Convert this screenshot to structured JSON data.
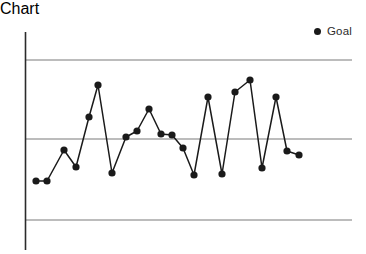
{
  "chart_data": {
    "type": "line",
    "title": "",
    "subtitle": "",
    "xlabel": "",
    "ylabel": "",
    "grid": false,
    "legend": {
      "position": "top-right",
      "entries": [
        {
          "label": "Goal",
          "marker": "filled-circle",
          "color": "#1a1a1a"
        }
      ]
    },
    "axis": {
      "y_axis_line": true,
      "x_axis_line": false,
      "xlim": [
        0,
        28
      ],
      "ylim": [
        -1.45,
        1.45
      ],
      "tick_labels_x": [],
      "tick_labels_y": []
    },
    "reference_lines": [
      {
        "name": "upper-limit",
        "value": 1.0,
        "color": "#7a7a7a"
      },
      {
        "name": "goal-center-line",
        "value": 0.0,
        "color": "#7a7a7a"
      },
      {
        "name": "lower-limit",
        "value": -1.0,
        "color": "#7a7a7a"
      }
    ],
    "series": [
      {
        "name": "Goal",
        "color": "#1a1a1a",
        "marker": "filled-circle",
        "x": [
          1,
          2,
          3,
          4,
          5,
          6,
          7,
          8,
          9,
          10,
          11,
          12,
          13,
          14,
          15,
          16,
          17,
          18,
          19,
          20,
          21,
          22,
          23,
          24,
          25,
          26,
          27
        ],
        "values": [
          -0.53,
          -0.53,
          -0.1,
          -0.39,
          0.35,
          0.68,
          -0.43,
          -0.01,
          0.09,
          0.38,
          0.15,
          0.13,
          -0.16,
          -0.51,
          0.53,
          -0.51,
          0.57,
          0.73,
          -0.41,
          0.56,
          -0.14,
          -0.2,
          0.0,
          0.0,
          0.0,
          0.0,
          0.0
        ]
      }
    ]
  },
  "points_px": {
    "note": "pixel geometry of the plotted series in the source raster",
    "coords": [
      [
        36,
        163
      ],
      [
        47,
        163
      ],
      [
        64,
        132
      ],
      [
        76,
        149
      ],
      [
        89,
        99
      ],
      [
        98,
        67
      ],
      [
        112,
        155
      ],
      [
        126,
        119
      ],
      [
        137,
        113
      ],
      [
        149,
        91
      ],
      [
        161,
        116
      ],
      [
        172,
        117
      ],
      [
        183,
        130
      ],
      [
        194,
        157
      ],
      [
        208,
        79
      ],
      [
        222,
        156
      ],
      [
        235,
        74
      ],
      [
        250,
        62
      ],
      [
        262,
        150
      ],
      [
        276,
        79
      ],
      [
        287,
        133
      ],
      [
        299,
        137
      ]
    ]
  },
  "geometry": {
    "axis_x": 25,
    "axis_y_top": 14,
    "axis_y_bottom": 232,
    "line_x_start": 25,
    "line_x_end": 352,
    "upper_line_y": 42,
    "center_line_y": 121,
    "lower_line_y": 202
  },
  "colors": {
    "background": "#ffffff",
    "series": "#1a1a1a",
    "reference_line": "#7a7a7a",
    "axis": "#2b2b2b",
    "legend_text": "#2b2b2b"
  },
  "legend": {
    "goal_label": "Goal"
  }
}
